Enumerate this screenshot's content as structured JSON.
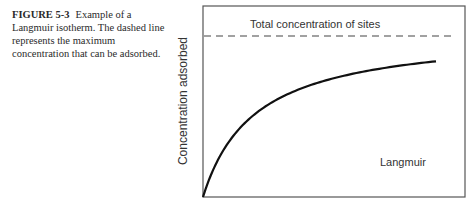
{
  "caption": {
    "label": "FIGURE 5-3",
    "text": "Example of a Langmuir isotherm. The dashed line represents the maximum concentration that can be adsorbed."
  },
  "chart_data": {
    "type": "line",
    "title": "",
    "xlabel": "",
    "ylabel": "Concentration adsorbed",
    "grid": false,
    "legend": null,
    "ticks": {
      "x": [],
      "y": []
    },
    "series": [
      {
        "name": "Langmuir",
        "style": "solid",
        "function": "q = Qmax*K*C/(1+K*C)",
        "x": [
          0,
          0.05,
          0.1,
          0.2,
          0.3,
          0.4,
          0.5,
          0.6,
          0.7,
          0.8,
          0.9,
          1.0
        ],
        "y": [
          0,
          0.32,
          0.49,
          0.66,
          0.75,
          0.8,
          0.83,
          0.85,
          0.87,
          0.88,
          0.89,
          0.9
        ]
      },
      {
        "name": "Total concentration of sites",
        "style": "dashed",
        "x": [
          0,
          1.0
        ],
        "y": [
          0.97,
          0.97
        ]
      }
    ],
    "annotations": [
      {
        "text": "Total concentration of sites",
        "position": "above dashed line"
      },
      {
        "text": "Langmuir",
        "position": "lower right"
      }
    ],
    "xlim": [
      0,
      1.1
    ],
    "ylim": [
      0,
      1.1
    ]
  },
  "curve_params": {
    "a": 52,
    "K": 166,
    "x_end": 233
  }
}
